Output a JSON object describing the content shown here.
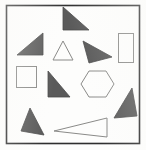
{
  "figure": {
    "background_color": "#fdfdfc",
    "fill_color": "#5a5a5a",
    "stroke_color": "#8a8a88",
    "frame_color": "#2e2e2e",
    "frame": {
      "x": 6.5,
      "y": 5.5,
      "width": 133,
      "height": 138,
      "stroke_width": 1.6
    },
    "counts": {
      "filled_triangles": 7,
      "outline_triangles": 2,
      "rectangles": 1,
      "squares": 1,
      "hexagons": 1,
      "total_shapes": 12
    },
    "shapes": [
      {
        "id": "triangle-top-center",
        "type": "triangle",
        "style": "filled",
        "points": "63,7 89,30 63,30",
        "fill": "#5a5a5a",
        "stroke": "#4a4a4a"
      },
      {
        "id": "triangle-upper-left",
        "type": "triangle",
        "style": "filled",
        "points": "17,55 43,33 43,55",
        "fill": "#5a5a5a",
        "stroke": "#4a4a4a"
      },
      {
        "id": "triangle-small-outline-center",
        "type": "triangle",
        "style": "outline",
        "points": "63,41 73,60 53,60",
        "fill": "none",
        "stroke": "#8a8a88"
      },
      {
        "id": "triangle-pointing-right",
        "type": "triangle",
        "style": "filled",
        "points": "83,41 112,57 89,63",
        "fill": "#5a5a5a",
        "stroke": "#4a4a4a"
      },
      {
        "id": "rectangle-upper-right",
        "type": "rectangle",
        "style": "outline",
        "x": 118.5,
        "y": 33.5,
        "width": 15,
        "height": 29,
        "fill": "none",
        "stroke": "#8a8a88"
      },
      {
        "id": "square-mid-left",
        "type": "square",
        "style": "outline",
        "x": 16.5,
        "y": 66.5,
        "width": 20,
        "height": 21,
        "fill": "none",
        "stroke": "#8a8a88"
      },
      {
        "id": "triangle-center-left",
        "type": "triangle",
        "style": "filled",
        "points": "48,71 70,97 48,97",
        "fill": "#5a5a5a",
        "stroke": "#4a4a4a"
      },
      {
        "id": "hexagon-center-right",
        "type": "hexagon",
        "style": "outline",
        "points": "89,71 106,71 114,84 106,97 89,97 81,84",
        "fill": "none",
        "stroke": "#8a8a88"
      },
      {
        "id": "triangle-right-lower",
        "type": "triangle",
        "style": "filled",
        "points": "132,88 137,116 114,118",
        "fill": "#5a5a5a",
        "stroke": "#4a4a4a"
      },
      {
        "id": "triangle-bottom-left",
        "type": "triangle",
        "style": "filled",
        "points": "30,108 44,135 21,131",
        "fill": "#5a5a5a",
        "stroke": "#4a4a4a"
      },
      {
        "id": "triangle-wide-outline-bottom",
        "type": "triangle",
        "style": "outline",
        "points": "54,131 107,118 107,137",
        "fill": "none",
        "stroke": "#8a8a88"
      }
    ]
  }
}
